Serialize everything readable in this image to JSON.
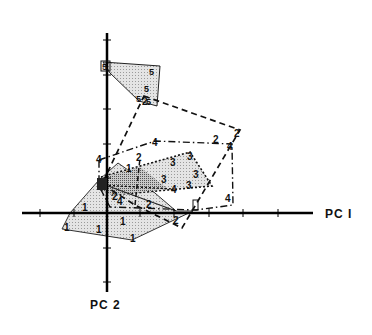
{
  "figure": {
    "type": "PCA score plot with convex hulls per group",
    "axes": {
      "x_label": "PC I",
      "y_label": "PC 2",
      "origin_px": [
        107,
        213
      ]
    },
    "groups": [
      {
        "id": "1",
        "label": "1",
        "fill": "#e9e9e9",
        "stroke": "solid",
        "hull": [
          [
            70,
            213
          ],
          [
            118,
            163
          ],
          [
            130,
            170
          ],
          [
            175,
            213
          ],
          [
            190,
            213
          ],
          [
            132,
            240
          ],
          [
            62,
            229
          ]
        ],
        "points": [
          [
            64,
            229
          ],
          [
            97,
            226
          ],
          [
            120,
            218
          ],
          [
            133,
            237
          ],
          [
            81,
            210
          ],
          [
            55,
            226
          ]
        ]
      },
      {
        "id": "2",
        "label": "2",
        "fill": "none",
        "stroke": "dashed",
        "hull": [
          [
            144,
            95
          ],
          [
            239,
            130
          ],
          [
            181,
            226
          ],
          [
            135,
            205
          ]
        ],
        "points": [
          [
            146,
            101
          ],
          [
            217,
            139
          ],
          [
            237,
            134
          ],
          [
            140,
            157
          ],
          [
            117,
            200
          ],
          [
            150,
            205
          ],
          [
            177,
            221
          ]
        ]
      },
      {
        "id": "3",
        "label": "3",
        "fill": "#bdbdbd",
        "stroke": "dotted",
        "hull": [
          [
            101,
            178
          ],
          [
            190,
            151
          ],
          [
            211,
            186
          ],
          [
            112,
            194
          ]
        ],
        "points": [
          [
            190,
            156
          ],
          [
            173,
            162
          ],
          [
            161,
            178
          ],
          [
            194,
            171
          ],
          [
            189,
            183
          ],
          [
            100,
            183
          ]
        ]
      },
      {
        "id": "4",
        "label": "4",
        "fill": "none",
        "stroke": "dash-dot",
        "hull": [
          [
            102,
            160
          ],
          [
            154,
            141
          ],
          [
            232,
            143
          ],
          [
            232,
            205
          ],
          [
            196,
            210
          ],
          [
            110,
            207
          ]
        ],
        "points": [
          [
            101,
            159
          ],
          [
            155,
            143
          ],
          [
            232,
            148
          ],
          [
            229,
            199
          ],
          [
            199,
            205
          ],
          [
            116,
            206
          ],
          [
            174,
            189
          ],
          [
            100,
            185
          ]
        ]
      },
      {
        "id": "5",
        "label": "5",
        "fill": "#efefef",
        "stroke": "solid",
        "hull": [
          [
            103,
            63
          ],
          [
            161,
            67
          ],
          [
            157,
            105
          ],
          [
            139,
            102
          ]
        ],
        "points": [
          [
            105,
            67
          ],
          [
            153,
            71
          ],
          [
            148,
            90
          ],
          [
            141,
            101
          ],
          [
            150,
            103
          ],
          [
            105,
            73
          ]
        ]
      }
    ]
  }
}
